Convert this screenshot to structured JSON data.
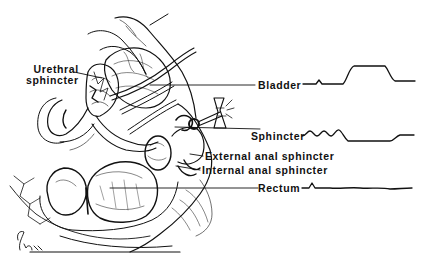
{
  "diagram": {
    "type": "anatomical-sagittal-section",
    "colors": {
      "ink": "#111111",
      "background": "#ffffff"
    },
    "labels": {
      "urethral_sphincter_line1": "Urethral",
      "urethral_sphincter_line2": "sphincter",
      "bladder": "Bladder",
      "sphincter": "Sphincter",
      "external_anal_sphincter": "External anal sphincter",
      "internal_anal_sphincter": "Internal anal sphincter",
      "rectum": "Rectum"
    },
    "signature": "G.Lees",
    "tracings": [
      {
        "name": "bladder-pressure-tracing",
        "description": "baseline with small blip, then raised plateau, then return to slightly elevated baseline"
      },
      {
        "name": "sphincter-pressure-tracing",
        "description": "three small oscillations, then drop to low level, then partial recovery"
      },
      {
        "name": "rectum-pressure-tracing",
        "description": "small peak then flat wavy baseline"
      }
    ]
  }
}
